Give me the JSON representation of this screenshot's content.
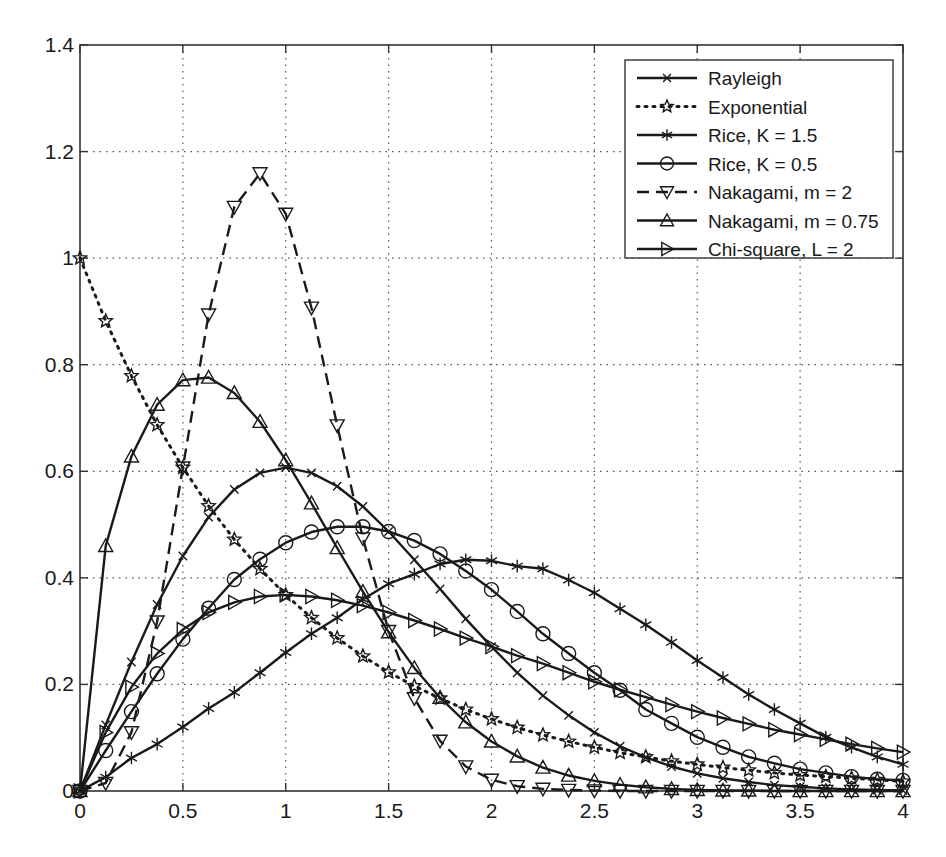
{
  "chart_data": {
    "type": "line",
    "title": "",
    "xlabel": "",
    "ylabel": "",
    "xlim": [
      0,
      4
    ],
    "ylim": [
      0,
      1.4
    ],
    "grid": true,
    "legend_position": "upper right",
    "x_ticks": [
      0,
      0.5,
      1,
      1.5,
      2,
      2.5,
      3,
      3.5,
      4
    ],
    "x_tick_labels": [
      "0",
      "0.5",
      "1",
      "1.5",
      "2",
      "2.5",
      "3",
      "3.5",
      "4"
    ],
    "y_ticks": [
      0,
      0.2,
      0.4,
      0.6,
      0.8,
      1.0,
      1.2,
      1.4
    ],
    "y_tick_labels": [
      "0",
      "0.2",
      "0.4",
      "0.6",
      "0.8",
      "1",
      "1.2",
      "1.4"
    ],
    "x": [
      0,
      0.125,
      0.25,
      0.375,
      0.5,
      0.625,
      0.75,
      0.875,
      1,
      1.125,
      1.25,
      1.375,
      1.5,
      1.625,
      1.75,
      1.875,
      2,
      2.125,
      2.25,
      2.375,
      2.5,
      2.625,
      2.75,
      2.875,
      3,
      3.125,
      3.25,
      3.375,
      3.5,
      3.625,
      3.75,
      3.875,
      4
    ],
    "series": [
      {
        "name": "Rayleigh",
        "line_style": "solid",
        "marker": "x",
        "values": [
          0,
          0.124,
          0.242,
          0.35,
          0.441,
          0.514,
          0.566,
          0.597,
          0.607,
          0.597,
          0.572,
          0.534,
          0.487,
          0.434,
          0.379,
          0.323,
          0.271,
          0.222,
          0.179,
          0.142,
          0.11,
          0.084,
          0.063,
          0.046,
          0.033,
          0.024,
          0.017,
          0.011,
          0.008,
          0.005,
          0.003,
          0.002,
          0.001
        ]
      },
      {
        "name": "Exponential",
        "line_style": "dotted",
        "marker": "star",
        "values": [
          1.0,
          0.882,
          0.779,
          0.687,
          0.607,
          0.535,
          0.472,
          0.417,
          0.368,
          0.325,
          0.287,
          0.253,
          0.223,
          0.197,
          0.174,
          0.153,
          0.135,
          0.119,
          0.105,
          0.093,
          0.082,
          0.072,
          0.064,
          0.056,
          0.05,
          0.044,
          0.039,
          0.034,
          0.03,
          0.027,
          0.024,
          0.021,
          0.018
        ]
      },
      {
        "name": "Rice, K = 1.5",
        "line_style": "solid",
        "marker": "asterisk",
        "values": [
          0,
          0.026,
          0.062,
          0.088,
          0.12,
          0.155,
          0.185,
          0.222,
          0.26,
          0.295,
          0.325,
          0.36,
          0.389,
          0.407,
          0.426,
          0.434,
          0.432,
          0.422,
          0.417,
          0.396,
          0.372,
          0.342,
          0.312,
          0.279,
          0.245,
          0.213,
          0.181,
          0.153,
          0.127,
          0.101,
          0.082,
          0.064,
          0.05
        ]
      },
      {
        "name": "Rice, K = 0.5",
        "line_style": "solid",
        "marker": "circle",
        "values": [
          0,
          0.076,
          0.149,
          0.22,
          0.285,
          0.343,
          0.397,
          0.435,
          0.466,
          0.486,
          0.496,
          0.496,
          0.487,
          0.47,
          0.445,
          0.413,
          0.378,
          0.337,
          0.295,
          0.258,
          0.222,
          0.189,
          0.153,
          0.127,
          0.101,
          0.082,
          0.064,
          0.052,
          0.041,
          0.034,
          0.027,
          0.022,
          0.02
        ]
      },
      {
        "name": "Nakagami, m = 2",
        "line_style": "dashed",
        "marker": "triangle-down",
        "values": [
          0,
          0.015,
          0.11,
          0.318,
          0.607,
          0.894,
          1.096,
          1.159,
          1.083,
          0.907,
          0.686,
          0.474,
          0.3,
          0.174,
          0.094,
          0.046,
          0.021,
          0.009,
          0.004,
          0.002,
          0.001,
          0,
          0,
          0,
          0,
          0,
          0,
          0,
          0,
          0,
          0,
          0,
          0
        ]
      },
      {
        "name": "Nakagami, m = 0.75",
        "line_style": "solid",
        "marker": "triangle-up",
        "values": [
          0,
          0.46,
          0.628,
          0.725,
          0.771,
          0.776,
          0.747,
          0.693,
          0.621,
          0.54,
          0.456,
          0.374,
          0.298,
          0.231,
          0.175,
          0.129,
          0.093,
          0.065,
          0.044,
          0.029,
          0.019,
          0.012,
          0.007,
          0.004,
          0.002,
          0.001,
          0.001,
          0,
          0,
          0,
          0,
          0,
          0
        ]
      },
      {
        "name": "Chi-square, L = 2",
        "line_style": "solid",
        "marker": "triangle-right",
        "values": [
          0,
          0.11,
          0.195,
          0.258,
          0.303,
          0.335,
          0.354,
          0.365,
          0.368,
          0.365,
          0.358,
          0.348,
          0.335,
          0.32,
          0.304,
          0.287,
          0.271,
          0.254,
          0.239,
          0.222,
          0.205,
          0.19,
          0.176,
          0.162,
          0.149,
          0.137,
          0.126,
          0.115,
          0.106,
          0.097,
          0.088,
          0.08,
          0.073
        ]
      }
    ]
  },
  "colors": {
    "line": "#1a1a1a",
    "grid": "#555555",
    "background": "#ffffff",
    "axes": "#333333"
  }
}
